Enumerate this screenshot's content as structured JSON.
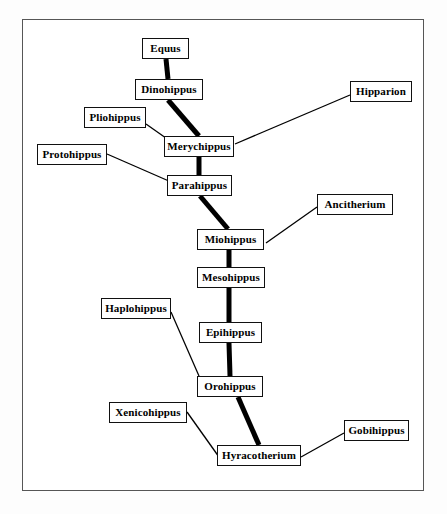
{
  "diagram": {
    "background_color": "#ffffff",
    "frame_color": "#565656",
    "box_border_color": "#111111",
    "line_color": "#000000",
    "main_lineage_stroke_px": 5,
    "branch_stroke_px": 1.3
  },
  "taxa": [
    {
      "id": "equus",
      "label": "Equus",
      "x": 142,
      "y": 38,
      "w": 47,
      "h": 21,
      "font_size": 11
    },
    {
      "id": "dinohippus",
      "label": "Dinohippus",
      "x": 135,
      "y": 79,
      "w": 68,
      "h": 21,
      "font_size": 11
    },
    {
      "id": "hipparion",
      "label": "Hipparion",
      "x": 350,
      "y": 81,
      "w": 62,
      "h": 21,
      "font_size": 11
    },
    {
      "id": "pliohippus",
      "label": "Pliohippus",
      "x": 84,
      "y": 107,
      "w": 62,
      "h": 21,
      "font_size": 11
    },
    {
      "id": "merychippus",
      "label": "Merychippus",
      "x": 164,
      "y": 136,
      "w": 70,
      "h": 21,
      "font_size": 11
    },
    {
      "id": "protohippus",
      "label": "Protohippus",
      "x": 37,
      "y": 144,
      "w": 70,
      "h": 21,
      "font_size": 11
    },
    {
      "id": "parahippus",
      "label": "Parahippus",
      "x": 167,
      "y": 175,
      "w": 65,
      "h": 21,
      "font_size": 11
    },
    {
      "id": "ancitherium",
      "label": "Ancitherium",
      "x": 317,
      "y": 194,
      "w": 76,
      "h": 21,
      "font_size": 11
    },
    {
      "id": "miohippus",
      "label": "Miohippus",
      "x": 197,
      "y": 229,
      "w": 67,
      "h": 21,
      "font_size": 11
    },
    {
      "id": "mesohippus",
      "label": "Mesohippus",
      "x": 197,
      "y": 267,
      "w": 68,
      "h": 21,
      "font_size": 11
    },
    {
      "id": "haplohippus",
      "label": "Haplohippus",
      "x": 101,
      "y": 298,
      "w": 70,
      "h": 21,
      "font_size": 11
    },
    {
      "id": "epihippus",
      "label": "Epihippus",
      "x": 199,
      "y": 322,
      "w": 63,
      "h": 21,
      "font_size": 11
    },
    {
      "id": "orohippus",
      "label": "Orohippus",
      "x": 197,
      "y": 376,
      "w": 66,
      "h": 21,
      "font_size": 11
    },
    {
      "id": "xenicohippus",
      "label": "Xenicohippus",
      "x": 109,
      "y": 402,
      "w": 78,
      "h": 21,
      "font_size": 11
    },
    {
      "id": "gobihippus",
      "label": "Gobihippus",
      "x": 344,
      "y": 420,
      "w": 65,
      "h": 21,
      "font_size": 11
    },
    {
      "id": "hyracotherium",
      "label": "Hyracotherium",
      "x": 217,
      "y": 445,
      "w": 84,
      "h": 21,
      "font_size": 11
    }
  ],
  "edges": [
    {
      "id": "equus-dinohippus",
      "from": "equus",
      "to": "dinohippus",
      "kind": "main",
      "x1": 166,
      "y1": 59,
      "x2": 168,
      "y2": 79
    },
    {
      "id": "dinohippus-merychippus",
      "from": "dinohippus",
      "to": "merychippus",
      "kind": "main",
      "x1": 168,
      "y1": 100,
      "x2": 199,
      "y2": 136
    },
    {
      "id": "merychippus-parahippus",
      "from": "merychippus",
      "to": "parahippus",
      "kind": "main",
      "x1": 199,
      "y1": 157,
      "x2": 199,
      "y2": 175
    },
    {
      "id": "parahippus-miohippus",
      "from": "parahippus",
      "to": "miohippus",
      "kind": "main",
      "x1": 200,
      "y1": 196,
      "x2": 228,
      "y2": 229
    },
    {
      "id": "miohippus-mesohippus",
      "from": "miohippus",
      "to": "mesohippus",
      "kind": "main",
      "x1": 229,
      "y1": 250,
      "x2": 229,
      "y2": 267
    },
    {
      "id": "mesohippus-epihippus",
      "from": "mesohippus",
      "to": "epihippus",
      "kind": "main",
      "x1": 229,
      "y1": 288,
      "x2": 229,
      "y2": 322
    },
    {
      "id": "epihippus-orohippus",
      "from": "epihippus",
      "to": "orohippus",
      "kind": "main",
      "x1": 229,
      "y1": 343,
      "x2": 230,
      "y2": 376
    },
    {
      "id": "orohippus-hyracotherium",
      "from": "orohippus",
      "to": "hyracotherium",
      "kind": "main",
      "x1": 238,
      "y1": 397,
      "x2": 259,
      "y2": 445
    },
    {
      "id": "pliohippus-merychippus",
      "from": "pliohippus",
      "to": "merychippus",
      "kind": "branch",
      "x1": 146,
      "y1": 124,
      "x2": 173,
      "y2": 143
    },
    {
      "id": "hipparion-merychippus",
      "from": "hipparion",
      "to": "merychippus",
      "kind": "branch",
      "x1": 350,
      "y1": 95,
      "x2": 235,
      "y2": 144
    },
    {
      "id": "protohippus-parahippus",
      "from": "protohippus",
      "to": "parahippus",
      "kind": "branch",
      "x1": 107,
      "y1": 154,
      "x2": 178,
      "y2": 185
    },
    {
      "id": "ancitherium-miohippus",
      "from": "ancitherium",
      "to": "miohippus",
      "kind": "branch",
      "x1": 317,
      "y1": 207,
      "x2": 266,
      "y2": 243
    },
    {
      "id": "haplohippus-orohippus",
      "from": "haplohippus",
      "to": "orohippus",
      "kind": "branch",
      "x1": 171,
      "y1": 312,
      "x2": 199,
      "y2": 376
    },
    {
      "id": "xenicohippus-hyracotherium",
      "from": "xenicohippus",
      "to": "hyracotherium",
      "kind": "branch",
      "x1": 187,
      "y1": 412,
      "x2": 219,
      "y2": 457
    },
    {
      "id": "gobihippus-hyracotherium",
      "from": "gobihippus",
      "to": "hyracotherium",
      "kind": "branch",
      "x1": 344,
      "y1": 433,
      "x2": 301,
      "y2": 457
    }
  ]
}
